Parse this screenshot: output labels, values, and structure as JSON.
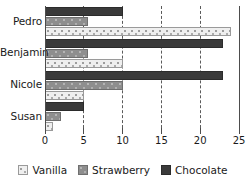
{
  "chart_data": {
    "type": "bar",
    "orientation": "horizontal",
    "title": "",
    "xlabel": "",
    "ylabel": "",
    "categories": [
      "Pedro",
      "Benjamin",
      "Nicole",
      "Susan"
    ],
    "series": [
      {
        "name": "Vanilla",
        "values": [
          24,
          10,
          5,
          1
        ],
        "color": "#efefef"
      },
      {
        "name": "Strawberry",
        "values": [
          5.5,
          5.5,
          10,
          2
        ],
        "color": "#8e8e8e"
      },
      {
        "name": "Chocolate",
        "values": [
          10,
          23,
          23,
          5
        ],
        "color": "#3a3a3a"
      }
    ],
    "series_draw_order_top_to_bottom": [
      "Chocolate",
      "Strawberry",
      "Vanilla"
    ],
    "xlim": [
      0,
      25
    ],
    "xticks": [
      0,
      5,
      10,
      15,
      20,
      25
    ],
    "xtick_labels": [
      "0",
      "5",
      "10",
      "15",
      "20",
      "25"
    ],
    "grid": true,
    "grid_style": "dashed-vertical",
    "legend_position": "bottom"
  },
  "axis": {
    "ticks": [
      {
        "label": "0",
        "value": 0
      },
      {
        "label": "5",
        "value": 5
      },
      {
        "label": "10",
        "value": 10
      },
      {
        "label": "15",
        "value": 15
      },
      {
        "label": "20",
        "value": 20
      },
      {
        "label": "25",
        "value": 25
      }
    ]
  },
  "groups": [
    {
      "label": "Pedro",
      "bars": [
        {
          "series": "Chocolate",
          "value": 10
        },
        {
          "series": "Strawberry",
          "value": 5.5
        },
        {
          "series": "Vanilla",
          "value": 24
        }
      ]
    },
    {
      "label": "Benjamin",
      "bars": [
        {
          "series": "Chocolate",
          "value": 23
        },
        {
          "series": "Strawberry",
          "value": 5.5
        },
        {
          "series": "Vanilla",
          "value": 10
        }
      ]
    },
    {
      "label": "Nicole",
      "bars": [
        {
          "series": "Chocolate",
          "value": 23
        },
        {
          "series": "Strawberry",
          "value": 10
        },
        {
          "series": "Vanilla",
          "value": 5
        }
      ]
    },
    {
      "label": "Susan",
      "bars": [
        {
          "series": "Chocolate",
          "value": 5
        },
        {
          "series": "Strawberry",
          "value": 2
        },
        {
          "series": "Vanilla",
          "value": 1
        }
      ]
    }
  ],
  "legend": {
    "items": [
      {
        "label": "Vanilla",
        "swatch": "vanilla"
      },
      {
        "label": "Strawberry",
        "swatch": "strawberry"
      },
      {
        "label": "Chocolate",
        "swatch": "chocolate"
      }
    ]
  }
}
